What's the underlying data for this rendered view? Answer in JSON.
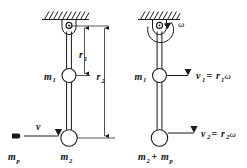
{
  "figure": {
    "background_color": "#ffffff",
    "ink_color": "#1a1a1a",
    "width": 247,
    "height": 168,
    "panels": [
      {
        "id": "left-panel",
        "name": "before-impact-diagram",
        "description": "Pendulum rod hanging from a ceiling pulley with masses m1 and m2; projectile mp moving with velocity v toward m2",
        "ceiling_hatch_count": 10,
        "labels": {
          "m1": "m",
          "m1_sub": "1",
          "m2": "m",
          "m2_sub": "2",
          "mp": "m",
          "mp_sub": "p",
          "v": "v",
          "r1": "r",
          "r1_sub": "1",
          "r2": "r",
          "r2_sub": "2"
        }
      },
      {
        "id": "right-panel",
        "name": "after-impact-diagram",
        "description": "Same rod rotating about the pulley with angular velocity omega; point velocities v1 and v2",
        "ceiling_hatch_count": 9,
        "labels": {
          "omega": "ω",
          "m1": "m",
          "m1_sub": "1",
          "m2_plus_mp": "m",
          "m2_sub": "2",
          "plus": "+",
          "mp": "m",
          "mp_sub": "p",
          "v1_eq": "v",
          "v1_sub": "1",
          "equals": "=",
          "r1": "r",
          "r1_sub": "1",
          "omega1": "ω",
          "v2_eq": "v",
          "v2_sub": "2",
          "equals2": "=",
          "r2": "r",
          "r2_sub": "2",
          "omega2": "ω"
        }
      }
    ]
  }
}
